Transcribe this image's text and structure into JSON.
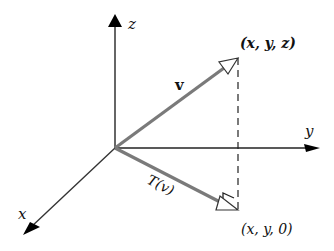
{
  "diagram": {
    "type": "3d-vector-projection",
    "axes": {
      "x_label": "x",
      "y_label": "y",
      "z_label": "z"
    },
    "vectors": {
      "v_label": "v",
      "tv_label": "T(v)"
    },
    "points": {
      "top_point": "(x, y, z)",
      "bottom_point": "(x, y, 0)"
    },
    "colors": {
      "axis": "#111111",
      "vector": "#7a7a7a",
      "dashed": "#222222"
    }
  }
}
